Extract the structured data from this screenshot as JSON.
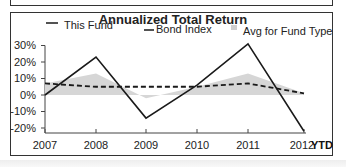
{
  "chart_data": {
    "type": "line",
    "title": "Annualized Total Return",
    "xlabel": "",
    "ylabel": "",
    "categories": [
      "2007",
      "2008",
      "2009",
      "2010",
      "2011",
      "2012"
    ],
    "x_suffix_label": "YTD",
    "ylim": [
      -20,
      30
    ],
    "yticks": [
      "30%",
      "20%",
      "10%",
      "0%",
      "-10%",
      "-20%"
    ],
    "grid": false,
    "legend_position": "top",
    "series": [
      {
        "name": "This Fund",
        "style": "solid",
        "values": [
          0,
          23,
          -14,
          6,
          31,
          -22
        ]
      },
      {
        "name": "Bond Index",
        "style": "dashed",
        "values": [
          7,
          5,
          5,
          5,
          7,
          1
        ]
      },
      {
        "name": "Avg for Fund Type",
        "style": "area",
        "values": [
          7,
          13,
          -2,
          5,
          13,
          1
        ]
      }
    ]
  },
  "legend": {
    "fund": "This Fund",
    "bond": "Bond Index",
    "avg": "Avg for Fund Type"
  },
  "axis": {
    "y": [
      "30%",
      "20%",
      "10%",
      "0%",
      "-10%",
      "-20%"
    ],
    "x": [
      "2007",
      "2008",
      "2009",
      "2010",
      "2011",
      "2012"
    ],
    "ytd": "YTD"
  },
  "colors": {
    "fund_line": "#1a1a1a",
    "bond_line": "#1a1a1a",
    "avg_area": "#d4d4d4"
  }
}
